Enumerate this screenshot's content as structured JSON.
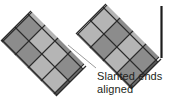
{
  "figure": {
    "type": "quilting-patchwork-diagram",
    "background_color": "#ffffff"
  },
  "annotation": {
    "line1": "Slanted ends",
    "line2": "aligned",
    "text_color": "#231f20",
    "leader_line": {
      "name": "leader-line",
      "color": "#9a9a9a",
      "x1": 68,
      "y1": 45,
      "x2": 96,
      "y2": 68
    }
  },
  "palette": {
    "light": "#b5b5b5",
    "medium": "#8c8c8c",
    "dark": "#6e6e6e",
    "darkest": "#5a5a5a",
    "outline": "#2b2b2b",
    "edge": "#1c1c1c"
  },
  "bands": [
    {
      "name": "left-band",
      "label": "lower left pieced band",
      "slant_angle_deg": -45,
      "rows": 2,
      "columns": 4,
      "patch_shape": "diamond",
      "patches": [
        {
          "row": 0,
          "col": 0,
          "shade": "medium"
        },
        {
          "row": 0,
          "col": 1,
          "shade": "medium"
        },
        {
          "row": 0,
          "col": 2,
          "shade": "light"
        },
        {
          "row": 0,
          "col": 3,
          "shade": "light"
        },
        {
          "row": 1,
          "col": 0,
          "shade": "darkest"
        },
        {
          "row": 1,
          "col": 1,
          "shade": "dark"
        },
        {
          "row": 1,
          "col": 2,
          "shade": "darkest"
        },
        {
          "row": 1,
          "col": 3,
          "shade": "dark"
        }
      ]
    },
    {
      "name": "right-band",
      "label": "upper right pieced band",
      "slant_angle_deg": -45,
      "rows": 2,
      "columns": 4,
      "patch_shape": "diamond",
      "patches": [
        {
          "row": 0,
          "col": 0,
          "shade": "light"
        },
        {
          "row": 0,
          "col": 1,
          "shade": "medium"
        },
        {
          "row": 0,
          "col": 2,
          "shade": "light"
        },
        {
          "row": 0,
          "col": 3,
          "shade": "medium"
        },
        {
          "row": 1,
          "col": 0,
          "shade": "dark"
        },
        {
          "row": 1,
          "col": 1,
          "shade": "darkest"
        },
        {
          "row": 1,
          "col": 2,
          "shade": "dark"
        },
        {
          "row": 1,
          "col": 3,
          "shade": "darkest"
        }
      ],
      "cut_edge": {
        "name": "right-cut-edge",
        "color": "#1c1c1c"
      }
    }
  ]
}
